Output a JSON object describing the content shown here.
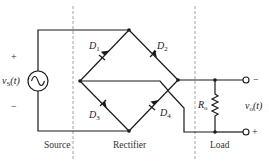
{
  "diagram": {
    "type": "full-wave bridge rectifier circuit",
    "sections": [
      {
        "label": "Source"
      },
      {
        "label": "Rectifier"
      },
      {
        "label": "Load"
      }
    ],
    "source": {
      "name": "v",
      "subscript": "S",
      "arg": "(t)",
      "plus": "+",
      "minus": "−",
      "symbol": "ac-source-icon"
    },
    "diodes": [
      {
        "name": "D",
        "subscript": "1"
      },
      {
        "name": "D",
        "subscript": "2"
      },
      {
        "name": "D",
        "subscript": "3"
      },
      {
        "name": "D",
        "subscript": "4"
      }
    ],
    "load": {
      "resistor": {
        "name": "R",
        "subscript": "o"
      },
      "output": {
        "name": "v",
        "subscript": "o",
        "arg": "(t)",
        "top_sign": "−",
        "bottom_sign": "+"
      }
    }
  }
}
